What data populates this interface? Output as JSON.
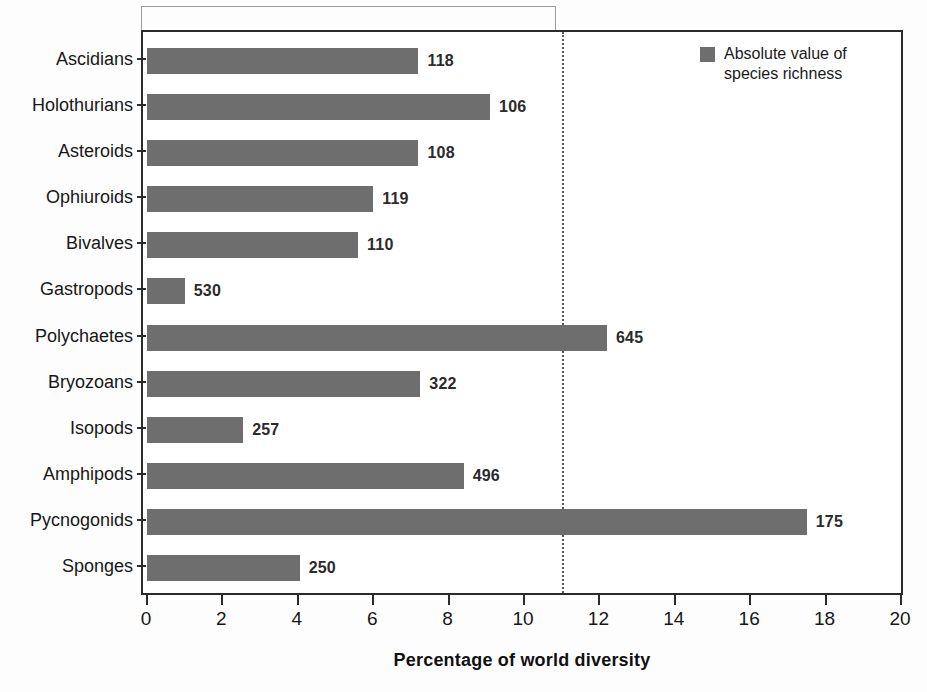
{
  "chart_data": {
    "type": "bar",
    "orientation": "horizontal",
    "title": "",
    "xlabel": "Percentage of world diversity",
    "ylabel": "",
    "xlim": [
      0,
      20
    ],
    "xticks": [
      0,
      2,
      4,
      6,
      8,
      10,
      12,
      14,
      16,
      18,
      20
    ],
    "grid": false,
    "legend_position": "top-right",
    "categories": [
      "Ascidians",
      "Holothurians",
      "Asteroids",
      "Ophiuroids",
      "Bivalves",
      "Gastropods",
      "Polychaetes",
      "Bryozoans",
      "Isopods",
      "Amphipods",
      "Pycnogonids",
      "Sponges"
    ],
    "values": [
      7.2,
      9.1,
      7.2,
      6.0,
      5.6,
      1.0,
      12.2,
      7.25,
      2.55,
      8.4,
      17.5,
      4.05
    ],
    "point_labels": [
      "118",
      "106",
      "108",
      "119",
      "110",
      "530",
      "645",
      "322",
      "257",
      "496",
      "175",
      "250"
    ],
    "series": [
      {
        "name": "Absolute value of species richness",
        "values": [
          7.2,
          9.1,
          7.2,
          6.0,
          5.6,
          1.0,
          12.2,
          7.25,
          2.55,
          8.4,
          17.5,
          4.05
        ],
        "labels": [
          "118",
          "106",
          "108",
          "119",
          "110",
          "530",
          "645",
          "322",
          "257",
          "496",
          "175",
          "250"
        ],
        "color": "#6e6e6e"
      }
    ],
    "annotations": [
      {
        "name": "reference-line",
        "type": "vertical-dotted-line",
        "x": 11.0,
        "color": "#5a5a5a"
      },
      {
        "name": "top-bracket",
        "type": "bracket",
        "x_start": 0.0,
        "x_end": 11.0,
        "color": "#9a9a9a"
      }
    ]
  },
  "legend": {
    "label": "Absolute value of\nspecies richness",
    "swatch_color": "#6e6e6e"
  },
  "axis": {
    "x_title": "Percentage of world diversity"
  },
  "colors": {
    "bar": "#6e6e6e",
    "frame": "#2b2b2b",
    "reference_line": "#5a5a5a",
    "bracket": "#9a9a9a",
    "text": "#171717"
  }
}
